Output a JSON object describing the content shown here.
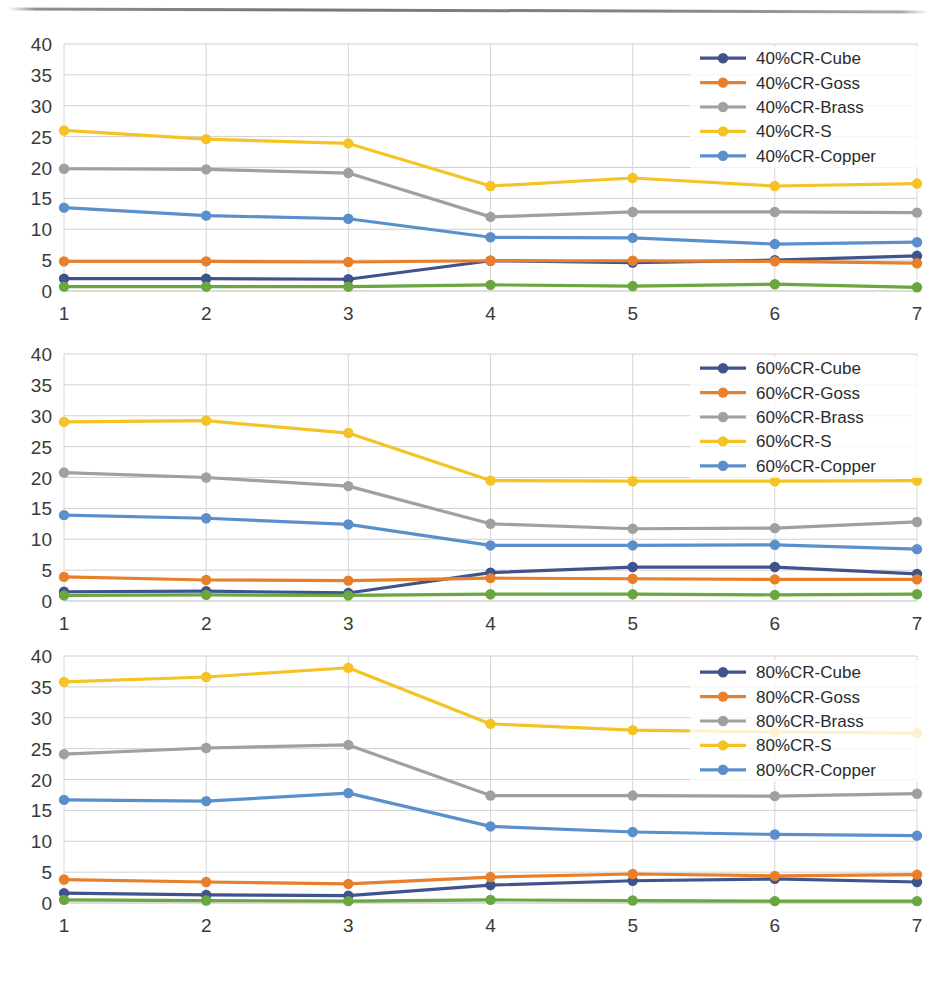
{
  "page": {
    "background": "#ffffff",
    "width": 937,
    "height": 998,
    "rule_present": true
  },
  "palette": {
    "cube": "#40538D",
    "goss": "#E8802B",
    "brass": "#A0A0A0",
    "s": "#F5C326",
    "copper": "#5B8FCB",
    "unlabeled_green": "#6AA740",
    "gridline": "#d0d0d0",
    "axis": "#b9b9b9",
    "text": "#3a3a3a"
  },
  "charts": [
    {
      "id": "chart-1",
      "name": "40pct-CR-chart",
      "legend_position": "top-right",
      "chart_data": {
        "type": "line",
        "title": "",
        "xlabel": "",
        "ylabel": "",
        "x": [
          1,
          2,
          3,
          4,
          5,
          6,
          7
        ],
        "categories": [
          "1",
          "2",
          "3",
          "4",
          "5",
          "6",
          "7"
        ],
        "xticklabels": [
          "1",
          "2",
          "3",
          "4",
          "5",
          "6",
          "7"
        ],
        "yticks": [
          0,
          5,
          10,
          15,
          20,
          25,
          30,
          35,
          40
        ],
        "yticklabels": [
          "0",
          "5",
          "10",
          "15",
          "20",
          "25",
          "30",
          "35",
          "40"
        ],
        "ylim": [
          0,
          40
        ],
        "xlim": [
          1,
          7
        ],
        "grid": true,
        "series": [
          {
            "name": "40%CR-Cube",
            "color": "#40538D",
            "marker": "circle",
            "values": [
              2.0,
              2.0,
              1.9,
              4.9,
              4.6,
              5.0,
              5.7
            ]
          },
          {
            "name": "40%CR-Goss",
            "color": "#E8802B",
            "marker": "circle",
            "values": [
              4.8,
              4.8,
              4.7,
              4.9,
              4.9,
              4.8,
              4.5
            ]
          },
          {
            "name": "40%CR-Brass",
            "color": "#A0A0A0",
            "marker": "circle",
            "values": [
              19.8,
              19.7,
              19.1,
              12.0,
              12.8,
              12.8,
              12.7
            ]
          },
          {
            "name": "40%CR-S",
            "color": "#F5C326",
            "marker": "circle",
            "values": [
              26.0,
              24.6,
              23.9,
              17.0,
              18.3,
              17.0,
              17.4
            ]
          },
          {
            "name": "40%CR-Copper",
            "color": "#5B8FCB",
            "marker": "circle",
            "values": [
              13.5,
              12.2,
              11.7,
              8.7,
              8.6,
              7.6,
              7.9
            ]
          },
          {
            "name": "",
            "color": "#6AA740",
            "marker": "circle",
            "in_legend": false,
            "values": [
              0.7,
              0.7,
              0.7,
              1.0,
              0.8,
              1.1,
              0.6
            ]
          }
        ],
        "legend": [
          "40%CR-Cube",
          "40%CR-Goss",
          "40%CR-Brass",
          "40%CR-S",
          "40%CR-Copper"
        ]
      }
    },
    {
      "id": "chart-2",
      "name": "60pct-CR-chart",
      "legend_position": "top-right",
      "chart_data": {
        "type": "line",
        "title": "",
        "xlabel": "",
        "ylabel": "",
        "x": [
          1,
          2,
          3,
          4,
          5,
          6,
          7
        ],
        "categories": [
          "1",
          "2",
          "3",
          "4",
          "5",
          "6",
          "7"
        ],
        "xticklabels": [
          "1",
          "2",
          "3",
          "4",
          "5",
          "6",
          "7"
        ],
        "yticks": [
          0,
          5,
          10,
          15,
          20,
          25,
          30,
          35,
          40
        ],
        "yticklabels": [
          "0",
          "5",
          "10",
          "15",
          "20",
          "25",
          "30",
          "35",
          "40"
        ],
        "ylim": [
          0,
          40
        ],
        "xlim": [
          1,
          7
        ],
        "grid": true,
        "series": [
          {
            "name": "60%CR-Cube",
            "color": "#40538D",
            "marker": "circle",
            "values": [
              1.5,
              1.6,
              1.3,
              4.6,
              5.5,
              5.5,
              4.4
            ]
          },
          {
            "name": "60%CR-Goss",
            "color": "#E8802B",
            "marker": "circle",
            "values": [
              3.9,
              3.4,
              3.3,
              3.7,
              3.6,
              3.5,
              3.5
            ]
          },
          {
            "name": "60%CR-Brass",
            "color": "#A0A0A0",
            "marker": "circle",
            "values": [
              20.8,
              20.0,
              18.6,
              12.5,
              11.7,
              11.8,
              12.8
            ]
          },
          {
            "name": "60%CR-S",
            "color": "#F5C326",
            "marker": "circle",
            "values": [
              29.0,
              29.2,
              27.2,
              19.5,
              19.4,
              19.4,
              19.5
            ]
          },
          {
            "name": "60%CR-Copper",
            "color": "#5B8FCB",
            "marker": "circle",
            "values": [
              13.9,
              13.4,
              12.4,
              9.0,
              9.0,
              9.1,
              8.4
            ]
          },
          {
            "name": "",
            "color": "#6AA740",
            "marker": "circle",
            "in_legend": false,
            "values": [
              0.9,
              1.0,
              0.9,
              1.1,
              1.1,
              1.0,
              1.1
            ]
          }
        ],
        "legend": [
          "60%CR-Cube",
          "60%CR-Goss",
          "60%CR-Brass",
          "60%CR-S",
          "60%CR-Copper"
        ]
      }
    },
    {
      "id": "chart-3",
      "name": "80pct-CR-chart",
      "legend_position": "top-right",
      "chart_data": {
        "type": "line",
        "title": "",
        "xlabel": "",
        "ylabel": "",
        "x": [
          1,
          2,
          3,
          4,
          5,
          6,
          7
        ],
        "categories": [
          "1",
          "2",
          "3",
          "4",
          "5",
          "6",
          "7"
        ],
        "xticklabels": [
          "1",
          "2",
          "3",
          "4",
          "5",
          "6",
          "7"
        ],
        "yticks": [
          0,
          5,
          10,
          15,
          20,
          25,
          30,
          35,
          40
        ],
        "yticklabels": [
          "0",
          "5",
          "10",
          "15",
          "20",
          "25",
          "30",
          "35",
          "40"
        ],
        "ylim": [
          0,
          40
        ],
        "xlim": [
          1,
          7
        ],
        "grid": true,
        "series": [
          {
            "name": "80%CR-Cube",
            "color": "#40538D",
            "marker": "circle",
            "values": [
              1.6,
              1.3,
              1.2,
              2.9,
              3.6,
              3.9,
              3.4
            ]
          },
          {
            "name": "80%CR-Goss",
            "color": "#E8802B",
            "marker": "circle",
            "values": [
              3.8,
              3.4,
              3.1,
              4.2,
              4.7,
              4.4,
              4.6
            ]
          },
          {
            "name": "80%CR-Brass",
            "color": "#A0A0A0",
            "marker": "circle",
            "values": [
              24.1,
              25.1,
              25.6,
              17.4,
              17.4,
              17.3,
              17.7
            ]
          },
          {
            "name": "80%CR-S",
            "color": "#F5C326",
            "marker": "circle",
            "values": [
              35.8,
              36.6,
              38.1,
              29.0,
              28.0,
              27.7,
              27.5
            ]
          },
          {
            "name": "80%CR-Copper",
            "color": "#5B8FCB",
            "marker": "circle",
            "values": [
              16.7,
              16.5,
              17.8,
              12.4,
              11.5,
              11.1,
              10.9
            ]
          },
          {
            "name": "",
            "color": "#6AA740",
            "marker": "circle",
            "in_legend": false,
            "values": [
              0.5,
              0.4,
              0.3,
              0.5,
              0.4,
              0.3,
              0.3
            ]
          }
        ],
        "legend": [
          "80%CR-Cube",
          "80%CR-Goss",
          "80%CR-Brass",
          "80%CR-S",
          "80%CR-Copper"
        ]
      }
    }
  ]
}
